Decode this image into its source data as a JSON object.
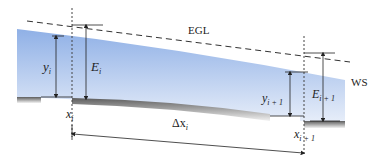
{
  "diagram": {
    "labels": {
      "egl": "EGL",
      "ws": "WS",
      "y_i": "y",
      "y_i_sub": "i",
      "E_i": "E",
      "E_i_sub": "i",
      "x_i": "x",
      "x_i_sub": "i",
      "y_ip1": "y",
      "y_ip1_sub": "i + 1",
      "E_ip1": "E",
      "E_ip1_sub": "i + 1",
      "x_ip1": "x",
      "x_ip1_sub": "i + 1",
      "dx": "Δx",
      "dx_sub": "i"
    },
    "colors": {
      "water_top": "#9db8e6",
      "water_bottom": "#dfe8f8",
      "bed_dark": "#6b6b6b",
      "line": "#222222"
    }
  }
}
